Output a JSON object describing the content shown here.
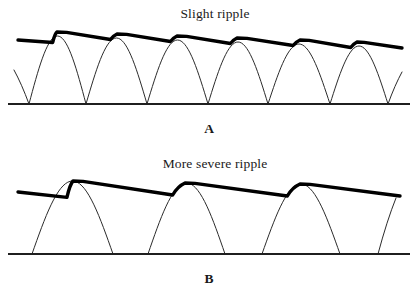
{
  "figure": {
    "background_color": "#ffffff",
    "width": 418,
    "height": 292
  },
  "colors": {
    "thick_line": "#000000",
    "thin_line": "#2b2b2b",
    "baseline": "#1f1f1f",
    "text": "#1a1a1a",
    "background": "#ffffff"
  },
  "panels": [
    {
      "id": "panel-a",
      "label": "A",
      "caption": "Slight ripple",
      "caption_x": 215,
      "caption_y": 18,
      "label_x": 209,
      "label_y": 133,
      "baseline_y": 104,
      "baseline_x_start": 8,
      "baseline_x_end": 410,
      "ripple_severity": "slight",
      "hump_count": 6,
      "hump_period": 60,
      "hump_peak_height": 68,
      "thick_line": {
        "x_start": 18,
        "x_end": 402,
        "y_at_start": 40,
        "y_at_end": 48,
        "ripple_depth": 5.5,
        "peaks_x": [
          57,
          117,
          177,
          237,
          300,
          357
        ],
        "peaks_y": [
          32,
          34,
          36,
          38,
          40,
          42
        ]
      },
      "thin_humps": [
        {
          "start": 29,
          "peak": 57,
          "end": 86,
          "height": 68
        },
        {
          "start": 86,
          "peak": 117,
          "end": 147,
          "height": 66
        },
        {
          "start": 147,
          "peak": 177,
          "end": 208,
          "height": 64
        },
        {
          "start": 208,
          "peak": 237,
          "end": 268,
          "height": 62
        },
        {
          "start": 268,
          "peak": 300,
          "end": 330,
          "height": 60
        },
        {
          "start": 330,
          "peak": 357,
          "end": 388,
          "height": 58
        }
      ],
      "partial_humps": [
        {
          "kind": "left-tail",
          "from_x": 14,
          "from_y": 70,
          "to_x": 29,
          "to_y": 104
        },
        {
          "kind": "right-tail",
          "from_x": 388,
          "from_y": 104,
          "to_x": 402,
          "to_y": 72
        }
      ]
    },
    {
      "id": "panel-b",
      "label": "B",
      "caption": "More severe ripple",
      "caption_x": 215,
      "caption_y": 168,
      "label_x": 209,
      "label_y": 283,
      "baseline_y": 254,
      "baseline_x_start": 8,
      "baseline_x_end": 410,
      "ripple_severity": "more severe",
      "hump_count": 3,
      "hump_period": 113,
      "hump_peak_height": 73,
      "thick_line": {
        "x_start": 18,
        "x_end": 400,
        "y_at_start": 192,
        "y_at_end": 196,
        "ripple_depth": 12,
        "peaks_x": [
          73,
          185,
          300
        ],
        "peaks_y": [
          181,
          183,
          184
        ]
      },
      "thin_humps": [
        {
          "start": 32,
          "peak": 73,
          "end": 113,
          "height": 73
        },
        {
          "start": 148,
          "peak": 185,
          "end": 225,
          "height": 71
        },
        {
          "start": 262,
          "peak": 300,
          "end": 340,
          "height": 70
        }
      ],
      "partial_humps": [
        {
          "kind": "right-tail",
          "from_x": 378,
          "from_y": 254,
          "to_x": 396,
          "to_y": 198
        }
      ]
    }
  ]
}
